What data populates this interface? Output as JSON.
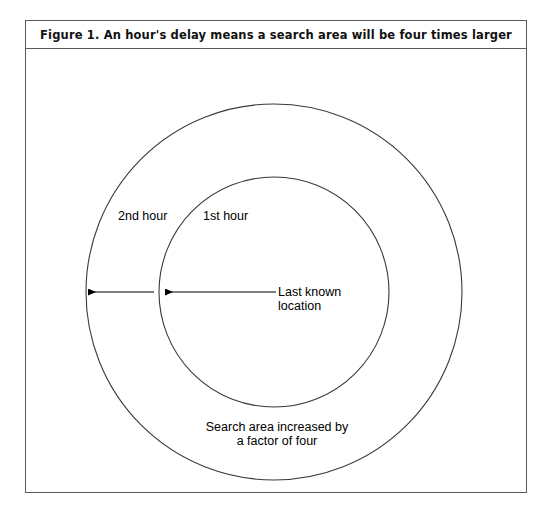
{
  "figure": {
    "title": "Figure 1. An hour's delay means a search area will be four times larger",
    "labels": {
      "outer_ring": "2nd hour",
      "inner_ring": "1st hour",
      "center_line1": "Last known",
      "center_line2": "location",
      "caption_line1": "Search area increased by",
      "caption_line2": "a factor of four"
    },
    "colors": {
      "border": "#5a5a5a",
      "circle_stroke": "#333333",
      "arrow": "#000000",
      "background": "#ffffff",
      "text": "#000000"
    },
    "geometry": {
      "center_x": 248,
      "center_y": 243,
      "outer_radius": 188,
      "inner_radius": 115,
      "arrow_y": 243,
      "outer_arrow_start": 248,
      "outer_arrow_end": 55,
      "inner_arrow_start": 248,
      "inner_arrow_end": 132
    }
  }
}
